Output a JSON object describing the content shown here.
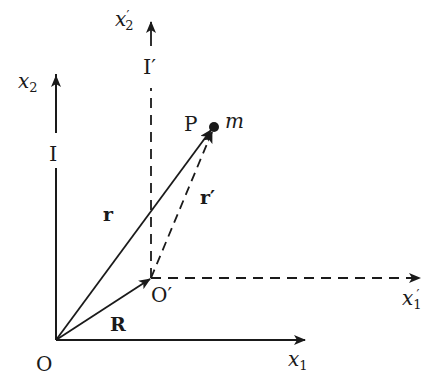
{
  "diagram": {
    "type": "coordinate-frames-vector-diagram",
    "colors": {
      "ink": "#1a1a1a",
      "background": "#ffffff"
    },
    "frames": {
      "I": {
        "label": "I",
        "origin_label": "O",
        "x1_label": "x",
        "x1_sub": "1",
        "x2_label": "x",
        "x2_sub": "2",
        "line_style": "solid"
      },
      "I_prime": {
        "label": "I′",
        "origin_label": "O′",
        "x1_label": "x",
        "x1_sub": "1",
        "x1_prime": "′",
        "x2_label": "x",
        "x2_sub": "2",
        "x2_prime": "′",
        "line_style": "dashed"
      }
    },
    "vectors": {
      "r": {
        "label": "r",
        "from": "O",
        "to": "P",
        "style": "solid"
      },
      "r_prime": {
        "label": "r′",
        "from": "O′",
        "to": "P",
        "style": "dashed"
      },
      "R": {
        "label": "R",
        "from": "O",
        "to": "O′",
        "style": "solid"
      }
    },
    "point": {
      "label": "P",
      "mass_label": "m"
    }
  }
}
